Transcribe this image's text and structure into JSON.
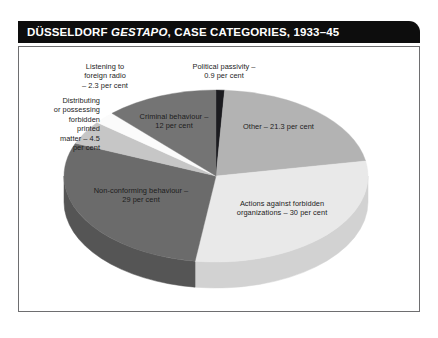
{
  "title": {
    "prefix": "DÜSSELDORF ",
    "italic": "GESTAPO",
    "suffix": ", CASE CATEGORIES, 1933–45",
    "full": "DÜSSELDORF GESTAPO, CASE CATEGORIES, 1933–45"
  },
  "colors": {
    "title_bar": "#0d0d0d",
    "title_text": "#ffffff",
    "frame_border": "#6e6e70",
    "background": "#ffffff",
    "label_text": "#1c1c1c"
  },
  "chart_data": {
    "type": "pie",
    "title": "DÜSSELDORF GESTAPO, CASE CATEGORIES, 1933–45",
    "xlabel": "",
    "ylabel": "",
    "units": "per cent",
    "legend": "none",
    "grid": false,
    "three_d": true,
    "start_angle_deg": 0,
    "direction": "clockwise",
    "categories": [
      "Political passivity",
      "Other",
      "Actions against forbidden organizations",
      "Non-conforming behaviour",
      "Distributing or possessing forbidden printed matter",
      "Listening to foreign radio",
      "Criminal behaviour"
    ],
    "values": [
      0.9,
      21.3,
      30,
      29,
      4.5,
      2.3,
      12
    ],
    "slices": [
      {
        "key": "political-passivity",
        "name": "Political passivity",
        "value": 0.9,
        "label": "Political passivity –\n0.9 per cent",
        "top_color": "#1b1b1f",
        "side_color": "#0e0e12"
      },
      {
        "key": "other",
        "name": "Other",
        "value": 21.3,
        "label": "Other – 21.3 per cent",
        "top_color": "#b3b3b3",
        "side_color": "#8f8f8f"
      },
      {
        "key": "actions-against-forbidden-organizations",
        "name": "Actions against forbidden organizations",
        "value": 30,
        "label": "Actions against forbidden\norganizations – 30 per cent",
        "top_color": "#e9e9e9",
        "side_color": "#d2d2d2"
      },
      {
        "key": "non-conforming-behaviour",
        "name": "Non-conforming behaviour",
        "value": 29,
        "label": "Non-conforming behaviour –\n29 per cent",
        "top_color": "#6b6b6b",
        "side_color": "#555555"
      },
      {
        "key": "distributing-or-possessing-forbidden-printed-matter",
        "name": "Distributing or possessing forbidden printed matter",
        "value": 4.5,
        "label": "Distributing\nor possessing\nforbidden\nprinted\nmatter – 4.5\nper cent",
        "top_color": "#c6c6c6",
        "side_color": "#a4a4a4"
      },
      {
        "key": "listening-to-foreign-radio",
        "name": "Listening to foreign radio",
        "value": 2.3,
        "label": "Listening to\nforeign radio\n– 2.3 per cent",
        "top_color": "#fbfbfb",
        "side_color": "#dcdcdc"
      },
      {
        "key": "criminal-behaviour",
        "name": "Criminal behaviour",
        "value": 12,
        "label": "Criminal behaviour –\n12 per cent",
        "top_color": "#747474",
        "side_color": "#5d5d5d"
      }
    ]
  }
}
